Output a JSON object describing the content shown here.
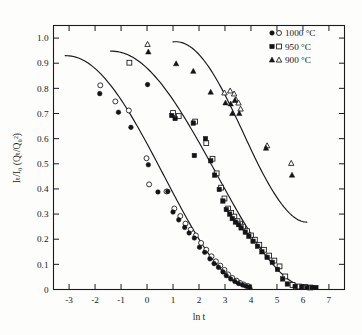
{
  "chart_data": {
    "type": "scatter",
    "title": "",
    "xlabel": "ln t",
    "ylabel": "Iₜ/I₀ (Qₜ/Q₀²)",
    "xlim": [
      -3.6,
      7.6
    ],
    "ylim": [
      0,
      1.05
    ],
    "grid": false,
    "legend_position": "top-right",
    "xticks": [
      -3,
      -2,
      -1,
      0,
      1,
      2,
      3,
      4,
      5,
      6,
      7
    ],
    "xticklabels": [
      "-3",
      "-2",
      "-1",
      "0",
      "1",
      "2",
      "3",
      "4",
      "5",
      "6",
      "7"
    ],
    "yticks": [
      0,
      0.1,
      0.2,
      0.3,
      0.4,
      0.5,
      0.6,
      0.7,
      0.8,
      0.9,
      1.0
    ],
    "yticklabels": [
      "0",
      "0.1",
      "0.2",
      "0.3",
      "0.4",
      "0.5",
      "0.6",
      "0.7",
      "0.8",
      "0.9",
      "1.0"
    ],
    "series": [
      {
        "name": "1000 °C",
        "marker": "circle",
        "legend_markers": [
          "filled-circle",
          "open-circle"
        ],
        "points_filled": [
          [
            -1.82,
            0.779
          ],
          [
            -1.1,
            0.705
          ],
          [
            -0.62,
            0.645
          ],
          [
            0.02,
            0.815
          ],
          [
            0.05,
            0.496
          ],
          [
            0.42,
            0.388
          ],
          [
            0.8,
            0.39
          ],
          [
            1.0,
            0.308
          ],
          [
            1.22,
            0.277
          ],
          [
            1.45,
            0.247
          ],
          [
            1.62,
            0.225
          ],
          [
            1.82,
            0.205
          ],
          [
            2.02,
            0.168
          ],
          [
            2.22,
            0.148
          ],
          [
            2.42,
            0.122
          ],
          [
            2.58,
            0.103
          ],
          [
            2.75,
            0.088
          ],
          [
            2.92,
            0.07
          ],
          [
            3.05,
            0.055
          ],
          [
            3.22,
            0.042
          ],
          [
            3.38,
            0.032
          ],
          [
            3.52,
            0.024
          ],
          [
            3.68,
            0.018
          ],
          [
            3.82,
            0.013
          ],
          [
            3.95,
            0.01
          ]
        ],
        "points_open": [
          [
            -1.8,
            0.812
          ],
          [
            -1.22,
            0.748
          ],
          [
            -0.7,
            0.712
          ],
          [
            -0.02,
            0.522
          ],
          [
            0.08,
            0.418
          ],
          [
            0.75,
            0.39
          ],
          [
            1.05,
            0.322
          ],
          [
            1.28,
            0.292
          ],
          [
            1.48,
            0.262
          ],
          [
            1.68,
            0.238
          ],
          [
            1.88,
            0.215
          ],
          [
            2.08,
            0.185
          ],
          [
            2.28,
            0.158
          ],
          [
            2.48,
            0.132
          ],
          [
            2.65,
            0.112
          ],
          [
            2.82,
            0.095
          ],
          [
            2.98,
            0.078
          ],
          [
            3.12,
            0.06
          ],
          [
            3.28,
            0.046
          ],
          [
            3.45,
            0.035
          ],
          [
            3.58,
            0.026
          ],
          [
            3.72,
            0.02
          ],
          [
            3.88,
            0.014
          ]
        ],
        "fit_start": [
          -3.15,
          0.93
        ],
        "fit_end": [
          4.05,
          0.005
        ]
      },
      {
        "name": "950 °C",
        "marker": "square",
        "legend_markers": [
          "filled-square",
          "open-square"
        ],
        "points_filled": [
          [
            0.95,
            0.692
          ],
          [
            1.08,
            0.68
          ],
          [
            1.78,
            0.662
          ],
          [
            1.82,
            0.533
          ],
          [
            2.25,
            0.6
          ],
          [
            2.45,
            0.512
          ],
          [
            2.6,
            0.455
          ],
          [
            2.78,
            0.398
          ],
          [
            2.92,
            0.352
          ],
          [
            3.05,
            0.318
          ],
          [
            3.18,
            0.3
          ],
          [
            3.28,
            0.282
          ],
          [
            3.4,
            0.268
          ],
          [
            3.52,
            0.258
          ],
          [
            3.62,
            0.245
          ],
          [
            3.78,
            0.228
          ],
          [
            3.92,
            0.212
          ],
          [
            4.08,
            0.192
          ],
          [
            4.25,
            0.172
          ],
          [
            4.42,
            0.15
          ],
          [
            4.62,
            0.128
          ],
          [
            4.82,
            0.108
          ],
          [
            5.02,
            0.08
          ],
          [
            5.22,
            0.042
          ],
          [
            5.4,
            0.022
          ],
          [
            5.7,
            0.012
          ],
          [
            5.95,
            0.01
          ],
          [
            6.15,
            0.008
          ],
          [
            6.35,
            0.008
          ],
          [
            6.5,
            0.008
          ]
        ],
        "points_open": [
          [
            -0.68,
            0.902
          ],
          [
            1.0,
            0.702
          ],
          [
            1.22,
            0.69
          ],
          [
            1.85,
            0.668
          ],
          [
            2.28,
            0.582
          ],
          [
            2.52,
            0.52
          ],
          [
            2.68,
            0.462
          ],
          [
            2.85,
            0.405
          ],
          [
            2.98,
            0.362
          ],
          [
            3.12,
            0.322
          ],
          [
            3.24,
            0.305
          ],
          [
            3.36,
            0.29
          ],
          [
            3.48,
            0.272
          ],
          [
            3.58,
            0.262
          ],
          [
            3.7,
            0.25
          ],
          [
            3.85,
            0.232
          ],
          [
            4.0,
            0.215
          ],
          [
            4.15,
            0.198
          ],
          [
            4.32,
            0.178
          ],
          [
            4.5,
            0.158
          ],
          [
            4.7,
            0.135
          ],
          [
            4.9,
            0.115
          ],
          [
            5.1,
            0.092
          ],
          [
            5.32,
            0.052
          ],
          [
            5.6,
            0.018
          ],
          [
            5.85,
            0.012
          ],
          [
            6.08,
            0.01
          ],
          [
            6.28,
            0.008
          ]
        ],
        "fit_start": [
          -1.4,
          0.948
        ],
        "fit_end": [
          6.3,
          0.005
        ]
      },
      {
        "name": "900 °C",
        "marker": "triangle",
        "legend_markers": [
          "filled-triangle",
          "open-triangle"
        ],
        "points_filled": [
          [
            0.05,
            0.945
          ],
          [
            1.12,
            0.898
          ],
          [
            1.78,
            0.868
          ],
          [
            2.45,
            0.785
          ],
          [
            3.02,
            0.742
          ],
          [
            3.22,
            0.738
          ],
          [
            3.28,
            0.7
          ],
          [
            3.38,
            0.752
          ],
          [
            3.55,
            0.7
          ],
          [
            4.58,
            0.562
          ],
          [
            5.58,
            0.455
          ]
        ],
        "points_open": [
          [
            0.02,
            0.975
          ],
          [
            2.98,
            0.782
          ],
          [
            3.2,
            0.79
          ],
          [
            3.35,
            0.778
          ],
          [
            3.42,
            0.755
          ],
          [
            3.52,
            0.742
          ],
          [
            3.6,
            0.718
          ],
          [
            4.62,
            0.572
          ],
          [
            5.55,
            0.502
          ]
        ],
        "fit_start": [
          1.0,
          0.985
        ],
        "fit_end": [
          6.15,
          0.268
        ]
      }
    ]
  },
  "axes": {
    "x_title": "ln t",
    "y_title": "Iₜ/I₀ (Qₜ/Q₀²)"
  },
  "legend": {
    "entries": [
      {
        "label": "1000 °C",
        "marker": "circle"
      },
      {
        "label": "950 °C",
        "marker": "square"
      },
      {
        "label": "900 °C",
        "marker": "triangle"
      }
    ]
  },
  "colors": {
    "ink": "#17171a",
    "background": "#fdfdfc"
  }
}
